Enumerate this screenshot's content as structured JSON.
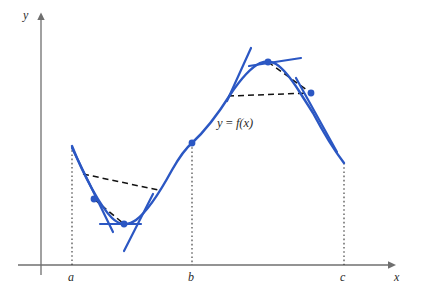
{
  "figure": {
    "kind": "calculus-graph",
    "width": 421,
    "height": 293,
    "background": "#ffffff"
  },
  "axes": {
    "x_axis": {
      "label": "x",
      "color": "#6f6f6f",
      "y_pixel": 265,
      "x_start": 18,
      "x_end": 392,
      "arrow": true
    },
    "y_axis": {
      "label": "y",
      "color": "#6f6f6f",
      "x_pixel": 41,
      "y_start": 275,
      "y_end": 16,
      "arrow": true
    },
    "ticks": [
      {
        "label": "a",
        "x_pixel": 72
      },
      {
        "label": "b",
        "x_pixel": 192
      },
      {
        "label": "c",
        "x_pixel": 344
      }
    ]
  },
  "curve": {
    "label": "y = f(x)",
    "label_y": "y",
    "label_eq": " = ",
    "label_f": "f",
    "label_arg": "(x)",
    "color": "#2b57c3",
    "stroke_width": 2.3
  },
  "marked_points": [
    {
      "name": "point-on-ab-descending",
      "x": 94,
      "y": 199
    },
    {
      "name": "point-local-minimum",
      "x": 124,
      "y": 224
    },
    {
      "name": "point-inflection-at-b",
      "x": 192,
      "y": 143
    },
    {
      "name": "point-local-maximum",
      "x": 268,
      "y": 62
    },
    {
      "name": "point-on-bc-descending",
      "x": 311,
      "y": 93
    }
  ],
  "secant_chords": {
    "color": "#111111",
    "style": "dashed",
    "chords": [
      {
        "name": "chord-upper-left",
        "from_x": 83,
        "from_y": 174,
        "to_x": 158,
        "to_y": 190
      },
      {
        "name": "chord-lower-left",
        "from_x": 94,
        "from_y": 199,
        "to_x": 124,
        "to_y": 224
      },
      {
        "name": "chord-horizontal-right",
        "from_x": 228,
        "from_y": 96,
        "to_x": 311,
        "to_y": 93
      },
      {
        "name": "chord-peak-right",
        "from_x": 268,
        "from_y": 62,
        "to_x": 311,
        "to_y": 93
      }
    ]
  },
  "tangent_lines": {
    "color": "#2b57c3",
    "lines": [
      {
        "name": "tangent-at-a",
        "x1": 72,
        "y1": 148,
        "x2": 112,
        "y2": 230
      },
      {
        "name": "tangent-at-local-minimum",
        "x1": 100,
        "y1": 224,
        "x2": 141,
        "y2": 224
      },
      {
        "name": "tangent-steep-rising",
        "x1": 125,
        "y1": 250,
        "x2": 152,
        "y2": 196
      },
      {
        "name": "tangent-rising-midslope",
        "x1": 227,
        "y1": 101,
        "x2": 251,
        "y2": 48
      },
      {
        "name": "tangent-at-local-maximum",
        "x1": 249,
        "y1": 66,
        "x2": 301,
        "y2": 58
      },
      {
        "name": "tangent-descending-right",
        "x1": 296,
        "y1": 78,
        "x2": 337,
        "y2": 152
      }
    ]
  },
  "dotted_verticals": {
    "color": "#333333",
    "style": "dotted",
    "lines": [
      {
        "name": "vertical-at-a",
        "x": 72,
        "y_top": 146,
        "y_bottom": 265
      },
      {
        "name": "vertical-at-b",
        "x": 192,
        "y_top": 143,
        "y_bottom": 265
      },
      {
        "name": "vertical-at-c",
        "x": 344,
        "y_top": 163,
        "y_bottom": 265
      }
    ]
  },
  "label_positions": {
    "y_axis_label": {
      "left": 23,
      "top": 9
    },
    "x_axis_label": {
      "left": 394,
      "top": 271
    },
    "tick_a": {
      "left": 68,
      "top": 271
    },
    "tick_b": {
      "left": 188,
      "top": 271
    },
    "tick_c": {
      "left": 340,
      "top": 271
    },
    "curve_label": {
      "left": 217,
      "top": 117
    }
  }
}
